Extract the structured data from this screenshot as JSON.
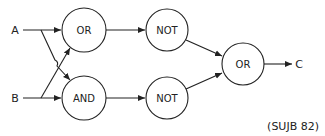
{
  "diagram": {
    "type": "logic-circuit",
    "inputs": [
      {
        "id": "A",
        "label": "A"
      },
      {
        "id": "B",
        "label": "B"
      }
    ],
    "output": {
      "id": "C",
      "label": "C"
    },
    "gates": [
      {
        "id": "or1",
        "label": "OR",
        "inputs": [
          "A",
          "B"
        ]
      },
      {
        "id": "and1",
        "label": "AND",
        "inputs": [
          "A",
          "B"
        ]
      },
      {
        "id": "not1",
        "label": "NOT",
        "inputs": [
          "or1"
        ]
      },
      {
        "id": "not2",
        "label": "NOT",
        "inputs": [
          "and1"
        ]
      },
      {
        "id": "or2",
        "label": "OR",
        "inputs": [
          "not1",
          "not2"
        ]
      }
    ],
    "edges": [
      [
        "A",
        "or1"
      ],
      [
        "A",
        "and1"
      ],
      [
        "B",
        "or1"
      ],
      [
        "B",
        "and1"
      ],
      [
        "or1",
        "not1"
      ],
      [
        "and1",
        "not2"
      ],
      [
        "not1",
        "or2"
      ],
      [
        "not2",
        "or2"
      ],
      [
        "or2",
        "C"
      ]
    ],
    "source": "(SUJB 82)"
  },
  "colors": {
    "stroke": "#222222",
    "background": "#ffffff"
  }
}
